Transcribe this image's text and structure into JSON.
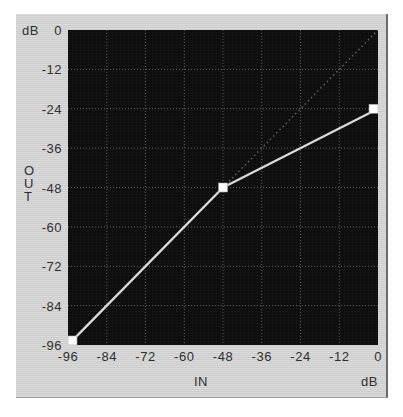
{
  "widget": {
    "name": "transfer-curve-editor",
    "panel_color": "#d2d2d2",
    "plot_background": "#0d0d0d",
    "curve_color": "#d9d9d9",
    "grid_color": "#6f6f6f",
    "reference_color": "#6a6a6a",
    "handle_fill": "#ffffff"
  },
  "axes": {
    "y_unit_label": "dB",
    "x_unit_label": "dB",
    "x_title": "IN",
    "y_title_lines": [
      "O",
      "U",
      "T"
    ],
    "y_ticks": [
      "0",
      "-12",
      "-24",
      "-36",
      "-48",
      "-60",
      "-72",
      "-84",
      "-96"
    ],
    "x_ticks": [
      "-96",
      "-84",
      "-72",
      "-60",
      "-48",
      "-36",
      "-24",
      "-12",
      "0"
    ]
  },
  "chart_data": {
    "type": "line",
    "title": "",
    "xlabel": "IN",
    "ylabel": "OUT",
    "xlim": [
      -96,
      0
    ],
    "ylim": [
      -96,
      0
    ],
    "xticks": [
      -96,
      -84,
      -72,
      -60,
      -48,
      -36,
      -24,
      -12,
      0
    ],
    "yticks": [
      -96,
      -84,
      -72,
      -60,
      -48,
      -36,
      -24,
      -12,
      0
    ],
    "grid": true,
    "legend": "none",
    "series": [
      {
        "name": "transfer-curve",
        "style": "solid",
        "color": "#d9d9d9",
        "x": [
          -96,
          -48,
          0
        ],
        "y": [
          -96,
          -48,
          -24
        ],
        "handles": [
          {
            "label": "handle-low",
            "x": -96,
            "y": -96
          },
          {
            "label": "handle-knee",
            "x": -48,
            "y": -48
          },
          {
            "label": "handle-high",
            "x": 0,
            "y": -24
          }
        ]
      },
      {
        "name": "unity-gain-reference",
        "style": "dotted",
        "color": "#6a6a6a",
        "x": [
          -96,
          0
        ],
        "y": [
          -96,
          0
        ],
        "handles": []
      }
    ]
  }
}
